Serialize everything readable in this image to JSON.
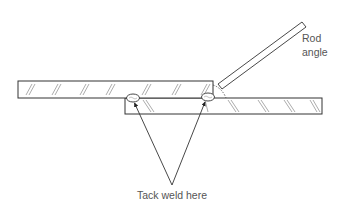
{
  "diagram": {
    "type": "welding lap joint illustration",
    "labels": {
      "rod_line1": "Rod",
      "rod_line2": "angle",
      "tack_weld": "Tack weld here"
    },
    "colors": {
      "line": "#333333",
      "hatch": "#777777",
      "text": "#555555",
      "background": "#ffffff"
    },
    "elements": {
      "top_plate": {
        "x": 18,
        "y": 81,
        "width": 195,
        "height": 17
      },
      "bottom_plate": {
        "x": 125,
        "y": 98,
        "width": 197,
        "height": 16
      },
      "welding_rod": {
        "from": [
          220,
          86
        ],
        "to": [
          304,
          24
        ]
      },
      "tack_welds": [
        {
          "cx": 133,
          "cy": 98
        },
        {
          "cx": 208,
          "cy": 97
        }
      ],
      "arrow_origin": [
        172,
        185
      ]
    }
  }
}
